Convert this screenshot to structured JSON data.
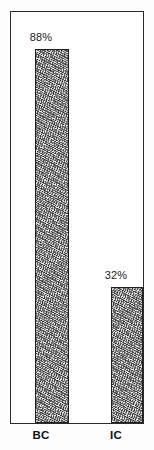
{
  "chart_data": {
    "type": "bar",
    "title": "",
    "subtitle": "",
    "xlabel": "",
    "ylabel": "",
    "categories": [
      "BC",
      "IC"
    ],
    "values": [
      88,
      32
    ],
    "value_labels": [
      "88%",
      "32%"
    ],
    "unit": "%",
    "ylim": [
      0,
      100
    ],
    "grid": false,
    "legend": false,
    "legend_position": "none",
    "series": [
      {
        "name": "",
        "values": [
          88,
          32
        ]
      }
    ],
    "bars": [
      {
        "category": "BC",
        "value": 88,
        "value_label": "88%"
      },
      {
        "category": "IC",
        "value": 32,
        "value_label": "32%"
      }
    ],
    "style": {
      "bar_fill": "#c9c9c9",
      "bar_texture": "stipple-noise",
      "bar_outline": "#1f1f1f",
      "frame_color": "#2b2b2b",
      "background": "#ffffff",
      "text_color": "#1a1a1a"
    }
  }
}
